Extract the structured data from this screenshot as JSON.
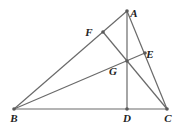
{
  "diagram": {
    "type": "geometry",
    "points": {
      "A": {
        "x": 127,
        "y": 11,
        "label": "A",
        "lx": 134,
        "ly": 17
      },
      "B": {
        "x": 14,
        "y": 109,
        "label": "B",
        "lx": 14,
        "ly": 122
      },
      "C": {
        "x": 167,
        "y": 109,
        "label": "C",
        "lx": 168,
        "ly": 122
      },
      "D": {
        "x": 127,
        "y": 109,
        "label": "D",
        "lx": 127,
        "ly": 122
      },
      "E": {
        "x": 145,
        "y": 53,
        "label": "E",
        "lx": 150,
        "ly": 58
      },
      "F": {
        "x": 103,
        "y": 32,
        "label": "F",
        "lx": 89,
        "ly": 36
      },
      "G": {
        "x": 127,
        "y": 61,
        "label": "G",
        "lx": 113,
        "ly": 75
      }
    },
    "segments": [
      [
        "A",
        "B"
      ],
      [
        "B",
        "C"
      ],
      [
        "C",
        "A"
      ],
      [
        "A",
        "D"
      ],
      [
        "B",
        "E"
      ],
      [
        "C",
        "F"
      ]
    ]
  }
}
